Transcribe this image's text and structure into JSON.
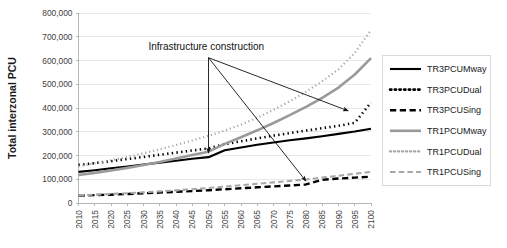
{
  "chart_data": {
    "type": "line",
    "title": "",
    "xlabel": "",
    "ylabel": "Total interzonal PCU",
    "xlim": [
      2010,
      2100
    ],
    "ylim": [
      0,
      800000
    ],
    "grid": true,
    "legend_position": "right",
    "x": [
      2010,
      2015,
      2020,
      2025,
      2030,
      2035,
      2040,
      2045,
      2050,
      2055,
      2060,
      2065,
      2070,
      2075,
      2080,
      2085,
      2090,
      2095,
      2100
    ],
    "xtick_labels": [
      "2010",
      "2015",
      "2020",
      "2025",
      "2030",
      "2035",
      "2040",
      "2045",
      "2050",
      "2055",
      "2060",
      "2065",
      "2070",
      "2075",
      "2080",
      "2085",
      "2090",
      "2095",
      "2100"
    ],
    "ytick_labels": [
      "0",
      "100,000",
      "200,000",
      "300,000",
      "400,000",
      "500,000",
      "600,000",
      "700,000",
      "800,000"
    ],
    "ytick_values": [
      0,
      100000,
      200000,
      300000,
      400000,
      500000,
      600000,
      700000,
      800000
    ],
    "series": [
      {
        "name": "TR3PCUMway",
        "color": "#000000",
        "style": "solid",
        "width": 2.1,
        "values": [
          131000,
          138000,
          146000,
          154000,
          162000,
          170000,
          178000,
          186000,
          193000,
          222000,
          234000,
          245000,
          255000,
          264000,
          272000,
          281000,
          291000,
          301000,
          313000
        ]
      },
      {
        "name": "TR3PCUDual",
        "color": "#000000",
        "style": "dotted",
        "width": 2.6,
        "values": [
          160000,
          168000,
          176000,
          185000,
          194000,
          203000,
          212000,
          221000,
          230000,
          248000,
          260000,
          272000,
          284000,
          294000,
          305000,
          315000,
          325000,
          338000,
          423000
        ]
      },
      {
        "name": "TR3PCUSing",
        "color": "#000000",
        "style": "dashed",
        "width": 2.4,
        "values": [
          31000,
          33000,
          35000,
          38000,
          41000,
          44000,
          47000,
          50000,
          54000,
          58000,
          62000,
          66000,
          70000,
          74000,
          78000,
          98000,
          103000,
          107000,
          111000
        ]
      },
      {
        "name": "TR1PCUMway",
        "color": "#9a9a9a",
        "style": "solid",
        "width": 2.6,
        "values": [
          118000,
          127000,
          137000,
          148000,
          160000,
          173000,
          187000,
          202000,
          216000,
          249000,
          277000,
          306000,
          337000,
          370000,
          405000,
          443000,
          486000,
          541000,
          610000
        ]
      },
      {
        "name": "TR1PCUDual",
        "color": "#a8a8a8",
        "style": "dotted",
        "width": 2.2,
        "values": [
          155000,
          167000,
          180000,
          194000,
          209000,
          226000,
          244000,
          263000,
          283000,
          305000,
          330000,
          359000,
          392000,
          428000,
          468000,
          513000,
          563000,
          632000,
          728000
        ]
      },
      {
        "name": "TR1PCUSing",
        "color": "#a8a8a8",
        "style": "dashed",
        "width": 2.1,
        "values": [
          32000,
          35000,
          38000,
          41000,
          45000,
          49000,
          53000,
          58000,
          63000,
          69000,
          75000,
          81000,
          87000,
          93000,
          99000,
          107000,
          115000,
          123000,
          131000
        ]
      }
    ],
    "annotations": [
      {
        "text": "Infrastructure construction",
        "anchor_x": 2050,
        "anchor_y": 612000,
        "targets": [
          {
            "x": 2050,
            "y": 210000
          },
          {
            "x": 2093,
            "y": 388000
          },
          {
            "x": 2080,
            "y": 92000
          }
        ]
      }
    ]
  },
  "legend": {
    "entries": [
      {
        "label": "TR3PCUMway"
      },
      {
        "label": "TR3PCUDual"
      },
      {
        "label": "TR3PCUSing"
      },
      {
        "label": "TR1PCUMway"
      },
      {
        "label": "TR1PCUDual"
      },
      {
        "label": "TR1PCUSing"
      }
    ]
  }
}
